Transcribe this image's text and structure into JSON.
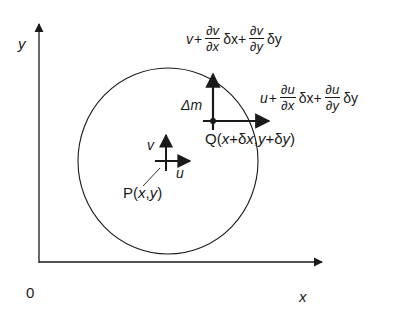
{
  "diagram": {
    "type": "fluid-element-velocity-field",
    "colors": {
      "stroke": "#1a1a1a",
      "background": "#ffffff"
    },
    "axes": {
      "origin_label": "0",
      "x_label": "x",
      "y_label": "y"
    },
    "region": {
      "shape": "circle",
      "mass_label": "Δm"
    },
    "point_p": {
      "label": "P(x,y)",
      "label_parts": {
        "prefix": "P(",
        "x": "x",
        "comma": ",",
        "y": "y",
        "suffix": ")"
      },
      "velocity_u_label": "u",
      "velocity_v_label": "v"
    },
    "point_q": {
      "label": "Q(x+δx,y+δy)",
      "label_parts": {
        "prefix": "Q(",
        "x": "x",
        "plus1": "+δ",
        "x2": "x",
        "comma": ",",
        "y": "y",
        "plus2": "+δ",
        "y2": "y",
        "suffix": ")"
      }
    },
    "v_expression": {
      "lead": "v",
      "plus": "+",
      "frac1": {
        "num": "∂v",
        "den": "∂x"
      },
      "term1": "δx+",
      "frac2": {
        "num": "∂v",
        "den": "∂y"
      },
      "term2": "δy"
    },
    "u_expression": {
      "lead": "u",
      "plus": "+",
      "frac1": {
        "num": "∂u",
        "den": "∂x"
      },
      "term1": "δx+",
      "frac2": {
        "num": "∂u",
        "den": "∂y"
      },
      "term2": "δy"
    }
  }
}
